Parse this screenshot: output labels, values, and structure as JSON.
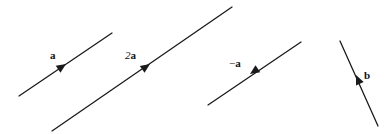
{
  "figure": {
    "width": 392,
    "height": 134,
    "background_color": "#ffffff",
    "stroke_color": "#1a1a1a",
    "stroke_width": 1.3
  },
  "chart_data": {
    "type": "diagram",
    "xlabel": "",
    "ylabel": "",
    "grid": false,
    "legend": "none",
    "axis_ranges": {
      "x": [
        0,
        392
      ],
      "y": [
        0,
        134
      ]
    },
    "vectors": [
      {
        "name": "a",
        "label_html": "<span class=\"sym\">a</span>",
        "label_text": "a",
        "x1": 19,
        "y1": 96,
        "x2": 112,
        "y2": 33,
        "arrow_x": 66,
        "arrow_y": 64,
        "arrow_direction": "up-right",
        "label_x": 50,
        "label_y": 50
      },
      {
        "name": "2a",
        "label_html": "<span class=\"coef\">2</span><span class=\"sym\">a</span>",
        "label_text": "2a",
        "x1": 52,
        "y1": 131,
        "x2": 232,
        "y2": 7,
        "arrow_x": 150,
        "arrow_y": 64,
        "arrow_direction": "up-right",
        "label_x": 125,
        "label_y": 50
      },
      {
        "name": "-a",
        "label_html": "<span class=\"neg\">&minus;</span><span class=\"sym\">a</span>",
        "label_text": "−a",
        "x1": 301,
        "y1": 42,
        "x2": 208,
        "y2": 105,
        "arrow_x": 250,
        "arrow_y": 74,
        "arrow_direction": "down-left",
        "label_x": 229,
        "label_y": 58
      },
      {
        "name": "b",
        "label_html": "<span class=\"sym\">b</span>",
        "label_text": "b",
        "x1": 378,
        "y1": 126,
        "x2": 340,
        "y2": 41,
        "arrow_x": 356,
        "arrow_y": 75,
        "arrow_direction": "up-left",
        "label_x": 364,
        "label_y": 70
      }
    ]
  }
}
